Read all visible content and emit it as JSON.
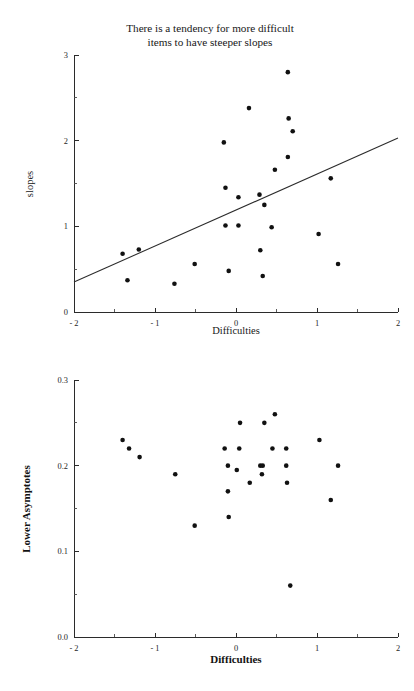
{
  "page": {
    "background": "#ffffff",
    "ink": "#111111",
    "width": 414,
    "height": 691
  },
  "figures": [
    {
      "id": "slopes",
      "title": "There is a tendency for more difficult\nitems to have steeper slopes",
      "xlabel": "Difficulties",
      "ylabel": "slopes"
    },
    {
      "id": "asymptotes",
      "title": "There is no relationship between difficulty\nand the lower asymptote",
      "xlabel": "Difficulties",
      "ylabel": "Lower Asymptotes"
    }
  ],
  "chart_data": [
    {
      "type": "scatter",
      "id": "slopes",
      "title": "There is a tendency for more difficult items to have steeper slopes",
      "xlabel": "Difficulties",
      "ylabel": "slopes",
      "xlim": [
        -2,
        2
      ],
      "ylim": [
        0,
        3
      ],
      "xticks": [
        -2,
        -1,
        0,
        1,
        2
      ],
      "xtick_labels": [
        "- 2",
        "- 1",
        "0",
        "1",
        "2"
      ],
      "xminor_step": 0.5,
      "yticks": [
        0,
        1,
        2,
        3
      ],
      "ytick_labels": [
        "0",
        "1",
        "2",
        "3"
      ],
      "yminor_step": 0.5,
      "grid": false,
      "legend": "none",
      "marker": {
        "shape": "circle",
        "color": "#111111",
        "size": 4.6
      },
      "points": [
        {
          "x": -1.4,
          "y": 0.68
        },
        {
          "x": -1.34,
          "y": 0.37
        },
        {
          "x": -1.2,
          "y": 0.73
        },
        {
          "x": -0.76,
          "y": 0.33
        },
        {
          "x": -0.51,
          "y": 0.56
        },
        {
          "x": -0.15,
          "y": 1.98
        },
        {
          "x": -0.13,
          "y": 1.45
        },
        {
          "x": -0.13,
          "y": 1.01
        },
        {
          "x": -0.09,
          "y": 0.48
        },
        {
          "x": 0.03,
          "y": 1.34
        },
        {
          "x": 0.03,
          "y": 1.01
        },
        {
          "x": 0.16,
          "y": 2.38
        },
        {
          "x": 0.29,
          "y": 1.37
        },
        {
          "x": 0.3,
          "y": 0.72
        },
        {
          "x": 0.33,
          "y": 0.42
        },
        {
          "x": 0.35,
          "y": 1.25
        },
        {
          "x": 0.44,
          "y": 0.99
        },
        {
          "x": 0.48,
          "y": 1.66
        },
        {
          "x": 0.64,
          "y": 2.8
        },
        {
          "x": 0.64,
          "y": 1.81
        },
        {
          "x": 0.65,
          "y": 2.26
        },
        {
          "x": 0.7,
          "y": 2.11
        },
        {
          "x": 1.02,
          "y": 0.91
        },
        {
          "x": 1.17,
          "y": 1.56
        },
        {
          "x": 1.26,
          "y": 0.56
        }
      ],
      "fit_line": {
        "type": "linear",
        "from": {
          "x": -2,
          "y": 0.35
        },
        "to": {
          "x": 2,
          "y": 2.03
        }
      },
      "annotation": "positive trend line drawn through the cloud"
    },
    {
      "type": "scatter",
      "id": "asymptotes",
      "title": "There is no relationship between difficulty and the lower asymptote",
      "xlabel": "Difficulties",
      "ylabel": "Lower Asymptotes",
      "xlim": [
        -2,
        2
      ],
      "ylim": [
        0.0,
        0.3
      ],
      "xticks": [
        -2,
        -1,
        0,
        1,
        2
      ],
      "xtick_labels": [
        "- 2",
        "- 1",
        "0",
        "1",
        "2"
      ],
      "xminor_step": 0.5,
      "yticks": [
        0.0,
        0.1,
        0.2,
        0.3
      ],
      "ytick_labels": [
        "0.0",
        "0.1",
        "0.2",
        "0.3"
      ],
      "yminor_step": 0.05,
      "grid": false,
      "legend": "none",
      "marker": {
        "shape": "circle",
        "color": "#111111",
        "size": 4.6
      },
      "points": [
        {
          "x": -1.4,
          "y": 0.23
        },
        {
          "x": -1.32,
          "y": 0.22
        },
        {
          "x": -1.19,
          "y": 0.21
        },
        {
          "x": -0.75,
          "y": 0.19
        },
        {
          "x": -0.51,
          "y": 0.13
        },
        {
          "x": -0.14,
          "y": 0.22
        },
        {
          "x": -0.1,
          "y": 0.2
        },
        {
          "x": -0.1,
          "y": 0.17
        },
        {
          "x": -0.09,
          "y": 0.14
        },
        {
          "x": 0.04,
          "y": 0.22
        },
        {
          "x": 0.05,
          "y": 0.25
        },
        {
          "x": 0.01,
          "y": 0.195
        },
        {
          "x": 0.17,
          "y": 0.18
        },
        {
          "x": 0.3,
          "y": 0.2
        },
        {
          "x": 0.33,
          "y": 0.2
        },
        {
          "x": 0.32,
          "y": 0.19
        },
        {
          "x": 0.35,
          "y": 0.25
        },
        {
          "x": 0.45,
          "y": 0.22
        },
        {
          "x": 0.48,
          "y": 0.26
        },
        {
          "x": 0.62,
          "y": 0.22
        },
        {
          "x": 0.62,
          "y": 0.2
        },
        {
          "x": 0.63,
          "y": 0.18
        },
        {
          "x": 0.67,
          "y": 0.06
        },
        {
          "x": 1.03,
          "y": 0.23
        },
        {
          "x": 1.17,
          "y": 0.16
        },
        {
          "x": 1.26,
          "y": 0.2
        }
      ],
      "fit_line": null,
      "annotation": "no trend line; one low outlier near 0.06"
    }
  ]
}
